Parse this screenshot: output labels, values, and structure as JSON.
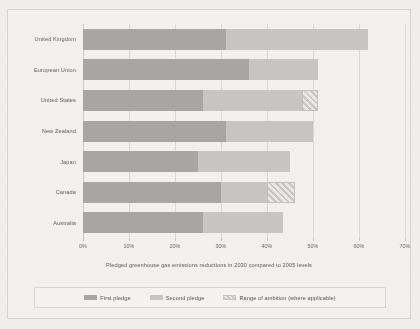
{
  "chart_data": {
    "type": "bar",
    "orientation": "horizontal",
    "stacked": true,
    "title": "",
    "caption": "Pledged greenhouse gas emissions reductions in 2030 compared to 2005 levels",
    "xlabel": "",
    "ylabel": "",
    "xlim": [
      0,
      70
    ],
    "x_unit": "%",
    "grid": "vertical",
    "tick_labels": [
      "0%",
      "10%",
      "20%",
      "30%",
      "40%",
      "50%",
      "60%",
      "70%"
    ],
    "tick_values": [
      0,
      10,
      20,
      30,
      40,
      50,
      60,
      70
    ],
    "categories": [
      "United Kingdom",
      "European Union",
      "United States",
      "New Zealand",
      "Japan",
      "Canada",
      "Australia"
    ],
    "series": [
      {
        "name": "First pledge",
        "color": "#a9a8a6",
        "values": [
          31,
          36,
          26,
          31,
          25,
          30,
          26
        ]
      },
      {
        "name": "Second pledge",
        "color": "#c9c8c5",
        "values": [
          62,
          51,
          47.5,
          50,
          45,
          40,
          43.5
        ]
      },
      {
        "name": "Range of ambition (where applicable)",
        "color": "#c9c8c5",
        "hatched": true,
        "values": [
          null,
          null,
          51,
          null,
          null,
          46,
          null
        ]
      }
    ],
    "legend": {
      "position": "bottom",
      "entries": [
        {
          "label": "First pledge",
          "swatch": "solid-dark"
        },
        {
          "label": "Second pledge",
          "swatch": "solid-light"
        },
        {
          "label": "Range of ambition (where applicable)",
          "swatch": "hatched"
        }
      ]
    },
    "rows": [
      {
        "category": "United Kingdom",
        "first": 31,
        "second": 62,
        "range_end": null
      },
      {
        "category": "European Union",
        "first": 36,
        "second": 51,
        "range_end": null
      },
      {
        "category": "United States",
        "first": 26,
        "second": 47.5,
        "range_end": 51
      },
      {
        "category": "New Zealand",
        "first": 31,
        "second": 50,
        "range_end": null
      },
      {
        "category": "Japan",
        "first": 25,
        "second": 45,
        "range_end": null
      },
      {
        "category": "Canada",
        "first": 30,
        "second": 40,
        "range_end": 46
      },
      {
        "category": "Australia",
        "first": 26,
        "second": 43.5,
        "range_end": null
      }
    ]
  }
}
